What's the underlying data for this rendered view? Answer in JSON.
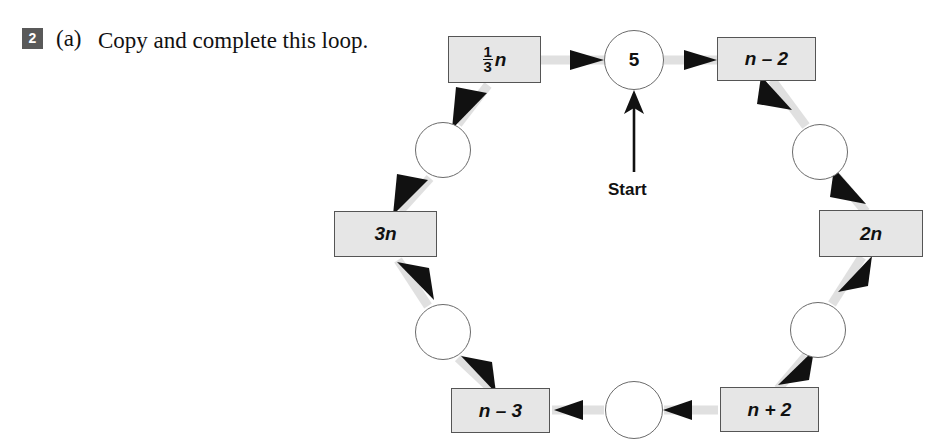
{
  "question": {
    "number": "2",
    "part_label": "(a)",
    "text": "Copy and complete this loop."
  },
  "diagram": {
    "type": "loop-flow-diagram",
    "start_label": "Start",
    "colors": {
      "box_fill": "#e6e6e6",
      "box_stroke": "#555555",
      "circle_stroke": "#6b6b6b",
      "connector": "#e0e0e0",
      "arrow_head": "#111111",
      "badge_bg": "#595959",
      "text": "#111111"
    },
    "nodes": [
      {
        "id": "n5",
        "shape": "circle",
        "label": "5",
        "blank": false,
        "cx": 634,
        "cy": 60,
        "r": 30
      },
      {
        "id": "n_minus_2",
        "shape": "box",
        "label": "n – 2",
        "blank": false,
        "x": 717,
        "y": 37,
        "w": 99,
        "h": 44
      },
      {
        "id": "blank_tr",
        "shape": "circle",
        "label": "",
        "blank": true,
        "cx": 820,
        "cy": 152,
        "r": 28
      },
      {
        "id": "two_n",
        "shape": "box",
        "label": "2n",
        "blank": false,
        "x": 819,
        "y": 210,
        "w": 104,
        "h": 47
      },
      {
        "id": "blank_br",
        "shape": "circle",
        "label": "",
        "blank": true,
        "cx": 818,
        "cy": 330,
        "r": 28
      },
      {
        "id": "n_plus_2",
        "shape": "box",
        "label": "n + 2",
        "blank": false,
        "x": 720,
        "y": 387,
        "w": 99,
        "h": 45
      },
      {
        "id": "blank_bc",
        "shape": "circle",
        "label": "",
        "blank": true,
        "cx": 634,
        "cy": 410,
        "r": 29
      },
      {
        "id": "n_minus_3",
        "shape": "box",
        "label": "n – 3",
        "blank": false,
        "x": 451,
        "y": 388,
        "w": 99,
        "h": 45
      },
      {
        "id": "blank_bl",
        "shape": "circle",
        "label": "",
        "blank": true,
        "cx": 443,
        "cy": 332,
        "r": 28
      },
      {
        "id": "three_n",
        "shape": "box",
        "label": "3n",
        "blank": false,
        "x": 334,
        "y": 211,
        "w": 103,
        "h": 46
      },
      {
        "id": "blank_tl",
        "shape": "circle",
        "label": "",
        "blank": true,
        "cx": 443,
        "cy": 150,
        "r": 28
      },
      {
        "id": "third_n",
        "shape": "box",
        "label_fraction": {
          "numerator": "1",
          "denominator": "3",
          "suffix": "n"
        },
        "blank": false,
        "x": 448,
        "y": 36,
        "w": 93,
        "h": 47
      }
    ],
    "edges": [
      {
        "from": "third_n",
        "to": "n5"
      },
      {
        "from": "n5",
        "to": "n_minus_2"
      },
      {
        "from": "n_minus_2",
        "to": "blank_tr"
      },
      {
        "from": "blank_tr",
        "to": "two_n"
      },
      {
        "from": "two_n",
        "to": "blank_br"
      },
      {
        "from": "blank_br",
        "to": "n_plus_2"
      },
      {
        "from": "n_plus_2",
        "to": "blank_bc"
      },
      {
        "from": "blank_bc",
        "to": "n_minus_3"
      },
      {
        "from": "n_minus_3",
        "to": "blank_bl"
      },
      {
        "from": "blank_bl",
        "to": "three_n"
      },
      {
        "from": "three_n",
        "to": "blank_tl"
      },
      {
        "from": "blank_tl",
        "to": "third_n"
      }
    ],
    "start_arrow": {
      "x": 634,
      "y_from": 172,
      "y_to": 92,
      "label_x": 634,
      "label_y": 190
    }
  }
}
